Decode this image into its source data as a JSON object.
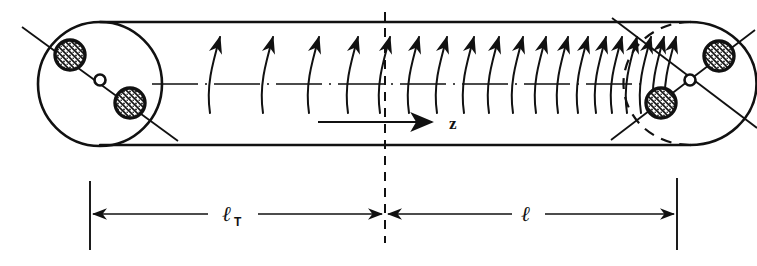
{
  "figure": {
    "background_color": "#ffffff",
    "ink_color": "#111111",
    "width": 757,
    "height": 266
  },
  "labels": {
    "axis_label": "z",
    "length_total": "ℓ",
    "length_total_subscript": "T",
    "length_partial": "ℓ"
  },
  "geometry": {
    "cylinder": {
      "left_center_x": 100,
      "right_center_x": 690,
      "axis_y": 79,
      "radius_y": 66,
      "top_edge_y": 22,
      "bottom_edge_y": 145,
      "end_cap_radius_x": 66
    },
    "center_line_x": 385,
    "center_line_top_y": 12,
    "center_line_bottom_y": 243,
    "dimension_line_y": 214,
    "dimension_left_tick_x": 90,
    "dimension_mid_tick_x": 385,
    "dimension_right_tick_x": 677,
    "dimension_tick_top_y": 181,
    "dimension_tick_bottom_y": 250
  },
  "field_arrows": {
    "description": "Curved field-line arrows crossing the axis, pointing upward, increasing in density toward the right end",
    "count": 19,
    "x_positions": [
      215,
      268,
      314,
      353,
      385,
      414,
      442,
      469,
      494,
      518,
      541,
      563,
      583,
      601,
      617,
      632,
      646,
      659,
      671
    ],
    "base_y": 113,
    "tip_y": 37
  },
  "coils": {
    "left_end": {
      "center": [
        100,
        79
      ],
      "diagonal_lines": 1,
      "diagonal_angle_deg": 40,
      "windings": [
        {
          "cx": 70,
          "cy": 54,
          "r": 14,
          "style": "hatched"
        },
        {
          "cx": 130,
          "cy": 104,
          "r": 14,
          "style": "hatched"
        }
      ],
      "hub": {
        "cx": 100,
        "cy": 79,
        "r": 5
      }
    },
    "right_end": {
      "center": [
        690,
        79
      ],
      "diagonal_lines": 2,
      "diagonal_angle_deg": 40,
      "windings": [
        {
          "cx": 719,
          "cy": 56,
          "r": 14,
          "style": "hatched"
        },
        {
          "cx": 661,
          "cy": 102,
          "r": 14,
          "style": "hatched"
        }
      ],
      "hub": {
        "cx": 690,
        "cy": 79,
        "r": 5
      },
      "dashed_back_arc": true
    }
  }
}
